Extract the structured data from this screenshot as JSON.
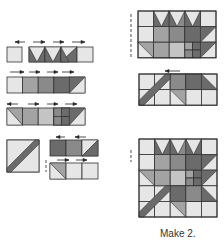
{
  "caption": "Make 2.",
  "colors": {
    "light": "#e6e6e6",
    "medium_light": "#c4c4c4",
    "medium": "#a3a3a3",
    "medium_dark": "#8a8a8a",
    "dark": "#6b6b6b",
    "stroke": "#333333",
    "arrow": "#222222"
  },
  "units": [
    {
      "id": "row1-single",
      "x": 7,
      "y": 47,
      "w": 15,
      "h": 15,
      "cells": [
        {
          "fill": "light"
        }
      ]
    },
    {
      "id": "row1-strip",
      "x": 29,
      "y": 47,
      "w": 64,
      "h": 15,
      "cols": 4,
      "cells": [
        {
          "type": "goose",
          "base": "light",
          "tri": "dark"
        },
        {
          "type": "goose",
          "base": "light",
          "tri": "dark"
        },
        {
          "type": "hst",
          "a": "light",
          "b": "dark"
        },
        {
          "fill": "light"
        }
      ]
    },
    {
      "id": "row2-strip",
      "x": 7,
      "y": 77,
      "w": 78,
      "h": 16,
      "cols": 5,
      "cells": [
        {
          "fill": "light"
        },
        {
          "fill": "medium"
        },
        {
          "fill": "medium_dark"
        },
        {
          "fill": "dark"
        },
        {
          "type": "hst2",
          "a": "dark",
          "b": "light"
        }
      ]
    },
    {
      "id": "row3-strip",
      "x": 7,
      "y": 108,
      "w": 78,
      "h": 17,
      "cols": 5,
      "cells": [
        {
          "type": "hst3",
          "a": "medium",
          "b": "light"
        },
        {
          "fill": "medium"
        },
        {
          "fill": "medium_light"
        },
        {
          "type": "nine",
          "fill": "dark"
        },
        {
          "type": "hst4",
          "a": "dark",
          "b": "light"
        }
      ]
    },
    {
      "id": "stem",
      "x": 7,
      "y": 140,
      "w": 32,
      "h": 32,
      "cells": [
        {
          "type": "stem"
        }
      ]
    },
    {
      "id": "row4-top",
      "x": 50,
      "y": 140,
      "w": 48,
      "h": 16,
      "cols": 3,
      "cells": [
        {
          "fill": "dark"
        },
        {
          "fill": "medium_dark"
        },
        {
          "type": "hst2",
          "a": "light",
          "b": "dark"
        }
      ]
    },
    {
      "id": "row4-bot",
      "x": 50,
      "y": 163,
      "w": 48,
      "h": 16,
      "cols": 3,
      "cells": [
        {
          "type": "hst5",
          "a": "medium",
          "b": "light"
        },
        {
          "fill": "light"
        },
        {
          "fill": "light"
        }
      ]
    }
  ],
  "arrows": [
    {
      "x1": 25,
      "x2": 15,
      "y": 42
    },
    {
      "x1": 33,
      "x2": 45,
      "y": 42
    },
    {
      "x1": 53,
      "x2": 64,
      "y": 42
    },
    {
      "x1": 72,
      "x2": 85,
      "y": 42
    },
    {
      "x1": 10,
      "x2": 24,
      "y": 72
    },
    {
      "x1": 29,
      "x2": 40,
      "y": 72
    },
    {
      "x1": 47,
      "x2": 58,
      "y": 72
    },
    {
      "x1": 62,
      "x2": 74,
      "y": 72
    },
    {
      "x1": 18,
      "x2": 7,
      "y": 104
    },
    {
      "x1": 28,
      "x2": 39,
      "y": 104
    },
    {
      "x1": 47,
      "x2": 58,
      "y": 104
    },
    {
      "x1": 65,
      "x2": 77,
      "y": 104
    },
    {
      "x1": 65,
      "x2": 56,
      "y": 137
    },
    {
      "x1": 86,
      "x2": 75,
      "y": 137
    },
    {
      "x1": 57,
      "x2": 69,
      "y": 160
    },
    {
      "x1": 76,
      "x2": 87,
      "y": 160
    },
    {
      "x1": 180,
      "x2": 165,
      "y": 71
    }
  ],
  "blocks": [
    {
      "id": "top-block",
      "x": 138,
      "y": 11,
      "cell": 15.6,
      "rows": 3
    },
    {
      "id": "mid-block",
      "x": 139,
      "y": 74,
      "cell": 15.6,
      "rows": 2
    },
    {
      "id": "final-block",
      "x": 139,
      "y": 139,
      "cell": 15.6,
      "rows": 5
    }
  ]
}
